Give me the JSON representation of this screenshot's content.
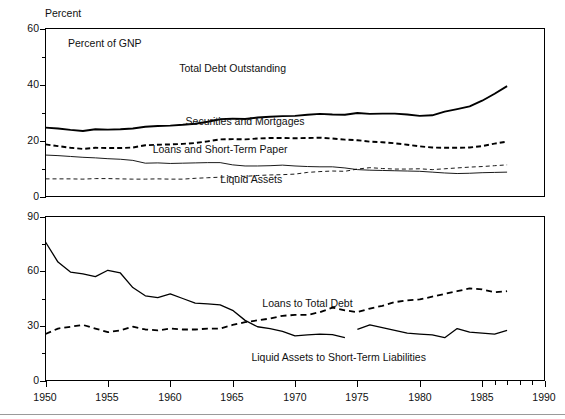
{
  "figure": {
    "background": "#ffffff",
    "ink_color": "#000000",
    "rule_color": "#9a9a9a"
  },
  "chart_data": [
    {
      "type": "line",
      "panel": "top",
      "title": "",
      "note": "Percent of GNP",
      "ylabel": "Percent",
      "xlabel": "",
      "xlim": [
        1950,
        1990
      ],
      "ylim": [
        0,
        60
      ],
      "grid": false,
      "legend": "inline-labels",
      "y_ticks_major": [
        0,
        20,
        40,
        60
      ],
      "y_ticks_minor": [
        10,
        30,
        50
      ],
      "x_ticks_major": [
        1950,
        1955,
        1960,
        1965,
        1970,
        1975,
        1980,
        1985,
        1990
      ],
      "x": [
        1950,
        1951,
        1952,
        1953,
        1954,
        1955,
        1956,
        1957,
        1958,
        1959,
        1960,
        1961,
        1962,
        1963,
        1964,
        1965,
        1966,
        1967,
        1968,
        1969,
        1970,
        1971,
        1972,
        1973,
        1974,
        1975,
        1976,
        1977,
        1978,
        1979,
        1980,
        1981,
        1982,
        1983,
        1984,
        1985,
        1986,
        1987
      ],
      "series": [
        {
          "name": "Total Debt Outstanding",
          "style": "solid-thick",
          "label_x": 1965.0,
          "label_y": 44.5,
          "values": [
            24.6,
            24.3,
            23.8,
            23.4,
            24.0,
            23.9,
            24.0,
            24.3,
            24.9,
            25.2,
            25.3,
            25.6,
            26.0,
            26.7,
            27.6,
            27.8,
            27.7,
            28.2,
            28.5,
            28.7,
            28.8,
            29.2,
            29.5,
            29.3,
            29.2,
            29.8,
            29.5,
            29.6,
            29.6,
            29.3,
            28.8,
            29.0,
            30.3,
            31.2,
            32.2,
            34.2,
            36.7,
            39.4
          ]
        },
        {
          "name": "Securities and Mortgages",
          "style": "dashed-thick",
          "label_x": 1966.0,
          "label_y": 25.5,
          "values": [
            18.6,
            18.0,
            17.4,
            17.0,
            17.4,
            17.3,
            17.3,
            17.5,
            18.3,
            18.5,
            18.6,
            18.8,
            19.1,
            19.7,
            20.4,
            20.5,
            20.4,
            20.7,
            20.9,
            20.9,
            20.8,
            20.9,
            21.0,
            20.7,
            20.3,
            20.1,
            19.6,
            19.4,
            19.0,
            18.5,
            17.9,
            17.5,
            17.4,
            17.4,
            17.5,
            18.0,
            18.9,
            19.6
          ]
        },
        {
          "name": "Loans and Short-Term Paper",
          "style": "solid-thin",
          "label_x": 1964.0,
          "label_y": 15.5,
          "values": [
            14.8,
            14.6,
            14.3,
            14.0,
            13.8,
            13.5,
            13.3,
            12.9,
            11.9,
            12.0,
            11.8,
            11.9,
            12.0,
            12.1,
            12.1,
            11.3,
            10.9,
            10.9,
            11.0,
            11.2,
            10.9,
            10.7,
            10.6,
            10.6,
            10.2,
            9.6,
            9.4,
            9.3,
            9.2,
            9.1,
            9.0,
            8.7,
            8.4,
            8.2,
            8.3,
            8.5,
            8.6,
            8.7
          ]
        },
        {
          "name": "Liquid Assets",
          "style": "dashed-thin",
          "label_x": 1966.5,
          "label_y": 5.0,
          "values": [
            6.3,
            6.3,
            6.3,
            6.2,
            6.4,
            6.4,
            6.3,
            6.2,
            6.2,
            6.3,
            6.2,
            6.2,
            6.5,
            6.7,
            6.9,
            7.1,
            7.2,
            7.5,
            7.7,
            7.8,
            8.0,
            8.6,
            8.9,
            9.1,
            9.0,
            9.8,
            10.3,
            10.0,
            9.8,
            9.8,
            9.9,
            9.6,
            9.9,
            10.2,
            10.5,
            10.7,
            11.0,
            11.3
          ]
        }
      ]
    },
    {
      "type": "line",
      "panel": "bottom",
      "title": "",
      "note": "",
      "ylabel": "",
      "xlabel": "",
      "xlim": [
        1950,
        1990
      ],
      "ylim": [
        0,
        90
      ],
      "grid": false,
      "legend": "inline-labels",
      "y_ticks_major": [
        0,
        30,
        60,
        90
      ],
      "y_ticks_minor": [
        15,
        45,
        75
      ],
      "x_ticks_major": [
        1950,
        1955,
        1960,
        1965,
        1970,
        1975,
        1980,
        1985,
        1990
      ],
      "x_ticks_minor": [
        1986,
        1987,
        1988,
        1989
      ],
      "x": [
        1950,
        1951,
        1952,
        1953,
        1954,
        1955,
        1956,
        1957,
        1958,
        1959,
        1960,
        1961,
        1962,
        1963,
        1964,
        1965,
        1966,
        1967,
        1968,
        1969,
        1970,
        1971,
        1972,
        1973,
        1974,
        1975,
        1976,
        1977,
        1978,
        1979,
        1980,
        1981,
        1982,
        1983,
        1984,
        1985,
        1986,
        1987
      ],
      "series": [
        {
          "name": "Liquid Assets to Short-Term Liabilities",
          "style": "solid-thin-bottom",
          "label_x": 1973.5,
          "label_y": 11.0,
          "break_after": 1974,
          "values": [
            76.0,
            65.0,
            59.5,
            58.5,
            57.0,
            60.5,
            59.0,
            51.0,
            46.5,
            45.5,
            47.5,
            45.0,
            42.5,
            42.0,
            41.5,
            38.5,
            33.0,
            29.5,
            28.5,
            27.0,
            24.5,
            25.0,
            25.5,
            25.2,
            23.5,
            28.0,
            30.5,
            29.0,
            27.5,
            26.0,
            25.5,
            25.0,
            23.5,
            28.5,
            26.5,
            26.0,
            25.5,
            27.5
          ]
        },
        {
          "name": "Loans to Total Debt",
          "style": "dashed-thick-bottom",
          "label_x": 1971.0,
          "label_y": 40.5,
          "values": [
            25.5,
            28.5,
            29.5,
            30.5,
            28.5,
            26.5,
            27.5,
            29.5,
            28.0,
            27.5,
            28.5,
            28.0,
            28.0,
            28.5,
            28.5,
            30.5,
            32.0,
            33.0,
            34.0,
            35.5,
            36.0,
            36.0,
            37.5,
            40.0,
            38.5,
            37.5,
            39.5,
            41.0,
            43.0,
            44.0,
            44.5,
            46.0,
            47.5,
            49.0,
            50.5,
            50.0,
            48.5,
            49.0
          ]
        }
      ]
    }
  ],
  "labels": {
    "y_axis_title_top": "Percent",
    "panel_note_top": "Percent of GNP",
    "top_y_0": "0",
    "top_y_20": "20",
    "top_y_40": "40",
    "top_y_60": "60",
    "bottom_y_0": "0",
    "bottom_y_30": "30",
    "bottom_y_60": "60",
    "bottom_y_90": "90",
    "x_1950": "1950",
    "x_1955": "1955",
    "x_1960": "1960",
    "x_1965": "1965",
    "x_1970": "1970",
    "x_1975": "1975",
    "x_1980": "1980",
    "x_1985": "1985",
    "x_1990": "1990",
    "s_total_debt": "Total Debt Outstanding",
    "s_securities": "Securities and Mortgages",
    "s_loans_stp": "Loans and Short-Term Paper",
    "s_liquid_assets": "Liquid Assets",
    "s_loans_total_debt": "Loans to Total Debt",
    "s_la_stl": "Liquid Assets to Short-Term Liabilities"
  }
}
